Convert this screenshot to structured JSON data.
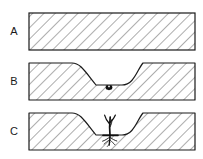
{
  "figure": {
    "background_color": "#ffffff",
    "outline_color": "#1a1a1a",
    "hatch_color": "#4a4a4a",
    "fill_color": "#ffffff",
    "seed_color": "#111111",
    "plant_color": "#111111",
    "panel_count": 3
  },
  "panels": [
    {
      "label": "A",
      "caption": "A",
      "state": "undisturbed soil block, flat level surface",
      "has_depression": false,
      "has_seed": false,
      "has_plant": false,
      "box": {
        "x": 29,
        "y": 13,
        "width": 166,
        "height": 37
      },
      "label_pos": {
        "x": 14,
        "y": 31
      }
    },
    {
      "label": "B",
      "caption": "B",
      "state": "soil block with depression, seed resting at base",
      "has_depression": true,
      "has_seed": true,
      "has_plant": false,
      "box": {
        "x": 29,
        "y": 63,
        "width": 166,
        "height": 37
      },
      "label_pos": {
        "x": 14,
        "y": 81
      },
      "seed": {
        "x": 109,
        "y": 87,
        "rx": 3.2,
        "ry": 2.4
      }
    },
    {
      "label": "C",
      "caption": "C",
      "state": "soil block with depression, germinated seedling with roots",
      "has_depression": true,
      "has_seed": false,
      "has_plant": true,
      "box": {
        "x": 29,
        "y": 113,
        "width": 166,
        "height": 37
      },
      "label_pos": {
        "x": 14,
        "y": 131
      },
      "plant": {
        "base_x": 110,
        "base_y": 135,
        "stem_top_y": 115,
        "root_depth_y": 146
      }
    }
  ],
  "geometry": {
    "depression": {
      "left_rim_x": 72,
      "slope_start_x": 72,
      "trough_left_x": 96,
      "trough_right_x": 122,
      "right_rim_x": 143,
      "rim_offset_y": 0,
      "trough_offset_y": 22
    },
    "hatch": {
      "angle_deg": 45,
      "spacing_px": 8,
      "line_width": 0.9
    }
  }
}
